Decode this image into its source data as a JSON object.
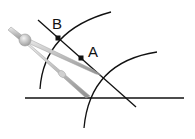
{
  "diagram": {
    "title": "",
    "labels": {
      "point_b": "B",
      "point_a": "A"
    },
    "points": [
      {
        "name": "B",
        "x": 58,
        "y": 38
      },
      {
        "name": "A",
        "x": 81,
        "y": 58
      }
    ],
    "elements": [
      "diagonal-line",
      "horizontal-line",
      "upper-arc",
      "lower-arc",
      "compass"
    ],
    "colors": {
      "line": "#111111",
      "compass_light": "#d9d9d9",
      "compass_mid": "#b3b3b3",
      "compass_dark": "#8c8c8c"
    }
  }
}
